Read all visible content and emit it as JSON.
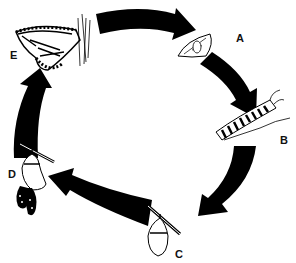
{
  "diagram": {
    "type": "life-cycle",
    "stages": [
      {
        "id": "A",
        "label": "A",
        "depicts": "egg on leaf"
      },
      {
        "id": "B",
        "label": "B",
        "depicts": "caterpillar (larva)"
      },
      {
        "id": "C",
        "label": "C",
        "depicts": "chrysalis (pupa)"
      },
      {
        "id": "D",
        "label": "D",
        "depicts": "butterfly emerging from chrysalis"
      },
      {
        "id": "E",
        "label": "E",
        "depicts": "adult butterfly"
      }
    ],
    "flow": [
      "E",
      "A",
      "B",
      "C",
      "D",
      "E"
    ],
    "arrow_color": "#000000",
    "background": "#ffffff"
  }
}
